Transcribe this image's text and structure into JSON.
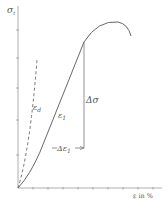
{
  "diagram": {
    "type": "stress-strain curve",
    "y_axis_label": "σ",
    "y_axis_subscript": "t",
    "x_axis_label": "ε  in %",
    "labels": {
      "dashed_line": "ε",
      "dashed_line_sub": "d",
      "curve": "ε",
      "curve_sub": "1",
      "delta_sigma": "Δσ",
      "delta_epsilon": "Δε",
      "delta_epsilon_sub": "1"
    },
    "colors": {
      "line": "#666666",
      "axis": "#999999",
      "text": "#555555"
    }
  }
}
